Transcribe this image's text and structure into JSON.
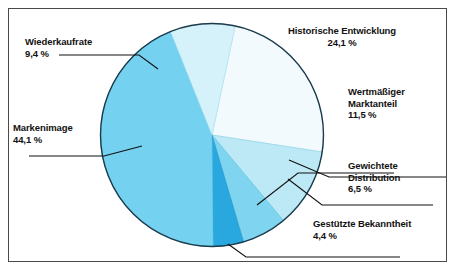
{
  "figure": {
    "background_color": "#ffffff",
    "frame_color": "#4a4a4a",
    "pie_outline_color": "#1b3a4b"
  },
  "chart_data": {
    "type": "pie",
    "title": "",
    "xlabel": "",
    "ylabel": "",
    "legend_position": "none",
    "grid": false,
    "unit": "%",
    "decimal_separator": ",",
    "start_angle_deg": 12,
    "direction": "clockwise",
    "categories": [
      "Historische Entwicklung",
      "Wertmäßiger Marktanteil",
      "Gewichtete Distribution",
      "Gestützte Bekanntheit",
      "Markenimage",
      "Wiederkaufrate"
    ],
    "values": [
      24.1,
      11.5,
      6.5,
      4.4,
      44.1,
      9.4
    ],
    "value_labels": [
      "24,1 %",
      "11,5 %",
      "6,5 %",
      "4,4 %",
      "44,1 %",
      "9,4 %"
    ],
    "colors": [
      "#f2fafd",
      "#bce9f5",
      "#7fd4ef",
      "#29a8e0",
      "#74d1f0",
      "#d5f2fa"
    ],
    "slices": [
      {
        "name": "Historische Entwicklung",
        "label": "Historische Entwicklung",
        "value": 24.1,
        "value_label": "24,1 %",
        "color": "#f2fafd"
      },
      {
        "name": "Wertmäßiger Marktanteil",
        "label_line1": "Wertmäßiger",
        "label_line2": "Marktanteil",
        "value": 11.5,
        "value_label": "11,5 %",
        "color": "#bce9f5"
      },
      {
        "name": "Gewichtete Distribution",
        "label_line1": "Gewichtete",
        "label_line2": "Distribution",
        "value": 6.5,
        "value_label": "6,5 %",
        "color": "#7fd4ef"
      },
      {
        "name": "Gestützte Bekanntheit",
        "label": "Gestützte Bekanntheit",
        "value": 4.4,
        "value_label": "4,4 %",
        "color": "#29a8e0"
      },
      {
        "name": "Markenimage",
        "label": "Markenimage",
        "value": 44.1,
        "value_label": "44,1 %",
        "color": "#74d1f0"
      },
      {
        "name": "Wiederkaufrate",
        "label": "Wiederkaufrate",
        "value": 9.4,
        "value_label": "9,4 %",
        "color": "#d5f2fa"
      }
    ]
  },
  "labels": {
    "historische": {
      "name": "Historische Entwicklung",
      "pct": "24,1 %"
    },
    "wertmaessiger": {
      "line1": "Wertmäßiger",
      "line2": "Marktanteil",
      "pct": "11,5 %"
    },
    "gewichtete": {
      "line1": "Gewichtete",
      "line2": "Distribution",
      "pct": "6,5 %"
    },
    "gestuetzte": {
      "name": "Gestützte Bekanntheit",
      "pct": "4,4 %"
    },
    "wiederkaufrate": {
      "name": "Wiederkaufrate",
      "pct": "9,4 %"
    },
    "markenimage": {
      "name": "Markenimage",
      "pct": "44,1 %"
    }
  }
}
